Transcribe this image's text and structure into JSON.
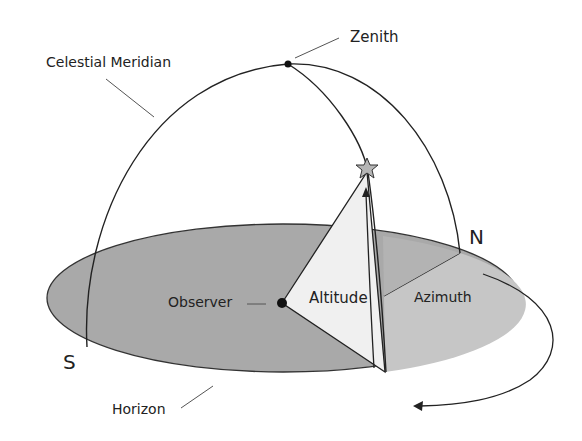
{
  "diagram": {
    "labels": {
      "celestial_meridian": "Celestial Meridian",
      "zenith": "Zenith",
      "observer": "Observer",
      "altitude": "Altitude",
      "azimuth": "Azimuth",
      "north": "N",
      "south": "S",
      "horizon": "Horizon"
    },
    "colors": {
      "horizon_plane": "#a9a9a9",
      "azimuth_wedge": "#c8c8c8",
      "altitude_wedge": "#f0f0f0",
      "star": "#b5b5b5",
      "line": "#222222",
      "background": "#ffffff"
    },
    "icons": {
      "star": "star-icon",
      "observer_point": "dot-icon",
      "zenith_point": "dot-icon",
      "rotation_arrow": "curved-arrow-icon"
    }
  }
}
